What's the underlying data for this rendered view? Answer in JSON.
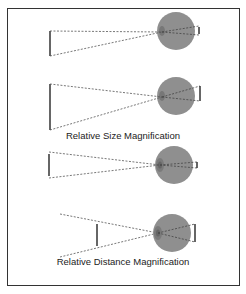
{
  "diagram": {
    "panels": [
      {
        "id": "size-a",
        "caption": null
      },
      {
        "id": "size-b",
        "caption": "Relative Size Magnification"
      },
      {
        "id": "distance-a",
        "caption": null
      },
      {
        "id": "distance-b",
        "caption": "Relative Distance Magnification"
      }
    ],
    "captions": {
      "size": "Relative Size Magnification",
      "distance": "Relative Distance Magnification"
    },
    "colors": {
      "eye_fill": "#8f8f8f",
      "eye_edge": "#7a7a7a",
      "line": "#333333",
      "ray": "#555555",
      "frame": "#333333"
    }
  }
}
